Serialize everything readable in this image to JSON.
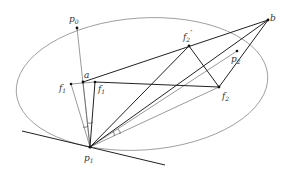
{
  "diagram": {
    "type": "geometry",
    "ellipse": {
      "cx": 142,
      "cy": 84,
      "rx": 126,
      "ry": 66,
      "stroke": "#8a8a8a"
    },
    "tangent_line": {
      "x1": 22,
      "y1": 131,
      "x2": 165,
      "y2": 165
    },
    "points": {
      "p0": {
        "x": 77,
        "y": 28,
        "label": "p",
        "sub": "0"
      },
      "p1": {
        "x": 90,
        "y": 147,
        "label": "p",
        "sub": "1"
      },
      "p2": {
        "x": 237,
        "y": 51,
        "label": "p",
        "sub": "2"
      },
      "a": {
        "x": 83,
        "y": 82,
        "label": "a",
        "sub": ""
      },
      "b": {
        "x": 268,
        "y": 20,
        "label": "b",
        "sub": ""
      },
      "f1": {
        "x": 71,
        "y": 84,
        "label": "f",
        "sub": "1"
      },
      "f1p": {
        "x": 95,
        "y": 82,
        "label": "f",
        "sub": "1",
        "prime": "′"
      },
      "f2": {
        "x": 219,
        "y": 87,
        "label": "f",
        "sub": "2"
      },
      "f2p": {
        "x": 189,
        "y": 46,
        "label": "f",
        "sub": "2",
        "prime": "′"
      }
    },
    "segments": [
      {
        "from": "p1",
        "to": "p0",
        "weight": "thin"
      },
      {
        "from": "p1",
        "to": "f1",
        "weight": "thin"
      },
      {
        "from": "p1",
        "to": "a",
        "weight": "thin"
      },
      {
        "from": "p1",
        "to": "f1p",
        "weight": "thick"
      },
      {
        "from": "p1",
        "to": "b",
        "weight": "thick"
      },
      {
        "from": "p1",
        "to": "p2",
        "weight": "thin"
      },
      {
        "from": "p1",
        "to": "f2",
        "weight": "thin"
      },
      {
        "from": "p1",
        "to": "f2p",
        "weight": "thick"
      },
      {
        "from": "a",
        "to": "b",
        "weight": "thick"
      },
      {
        "from": "f1",
        "to": "f1p",
        "weight": "thin"
      },
      {
        "from": "f1p",
        "to": "f2",
        "weight": "thick"
      },
      {
        "from": "f2p",
        "to": "f2",
        "weight": "thick"
      },
      {
        "from": "f2",
        "to": "b",
        "weight": "thick"
      }
    ],
    "labels": {
      "p0": "p",
      "p0_sub": "0",
      "p1": "p",
      "p1_sub": "1",
      "p2": "p",
      "p2_sub": "2",
      "a": "a",
      "b": "b",
      "f1": "f",
      "f1_sub": "1",
      "f1p": "f",
      "f1p_sub": "1",
      "f1p_prime": "′",
      "f2": "f",
      "f2_sub": "2",
      "f2p": "f",
      "f2p_sub": "2",
      "f2p_prime": "′"
    }
  }
}
